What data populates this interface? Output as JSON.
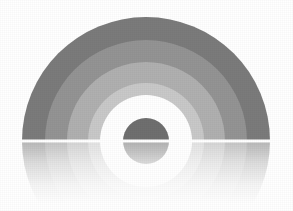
{
  "graphic": {
    "title": "Concentric semicircular arc with mirrored reflection",
    "background_color": "#ffffff",
    "canvas": {
      "width": 293,
      "height": 211
    },
    "center": {
      "x": 146,
      "y": 141
    },
    "baseline": {
      "y": 141,
      "color": "#ffffff",
      "thickness": 3,
      "label": "horizon-line"
    },
    "reflection": {
      "enabled": true,
      "opacity_top": 0.55,
      "opacity_bottom": 0.0,
      "fade_height": 62,
      "label": "mirror-reflection"
    },
    "rings": [
      {
        "name": "ring-outer-dark",
        "outer_radius": 124,
        "inner_radius": 101,
        "color": "#7b7b7b"
      },
      {
        "name": "ring-second-mid-dark",
        "outer_radius": 101,
        "inner_radius": 79,
        "color": "#949494"
      },
      {
        "name": "ring-third-mid",
        "outer_radius": 79,
        "inner_radius": 58,
        "color": "#b0b0b0"
      },
      {
        "name": "ring-fourth-light",
        "outer_radius": 58,
        "inner_radius": 46,
        "color": "#c9c9c9"
      },
      {
        "name": "ring-inner-white",
        "outer_radius": 46,
        "inner_radius": 23,
        "color": "#ffffff"
      }
    ],
    "center_disc": {
      "name": "center-disc",
      "radius": 23,
      "color": "#6f6f6f"
    }
  }
}
